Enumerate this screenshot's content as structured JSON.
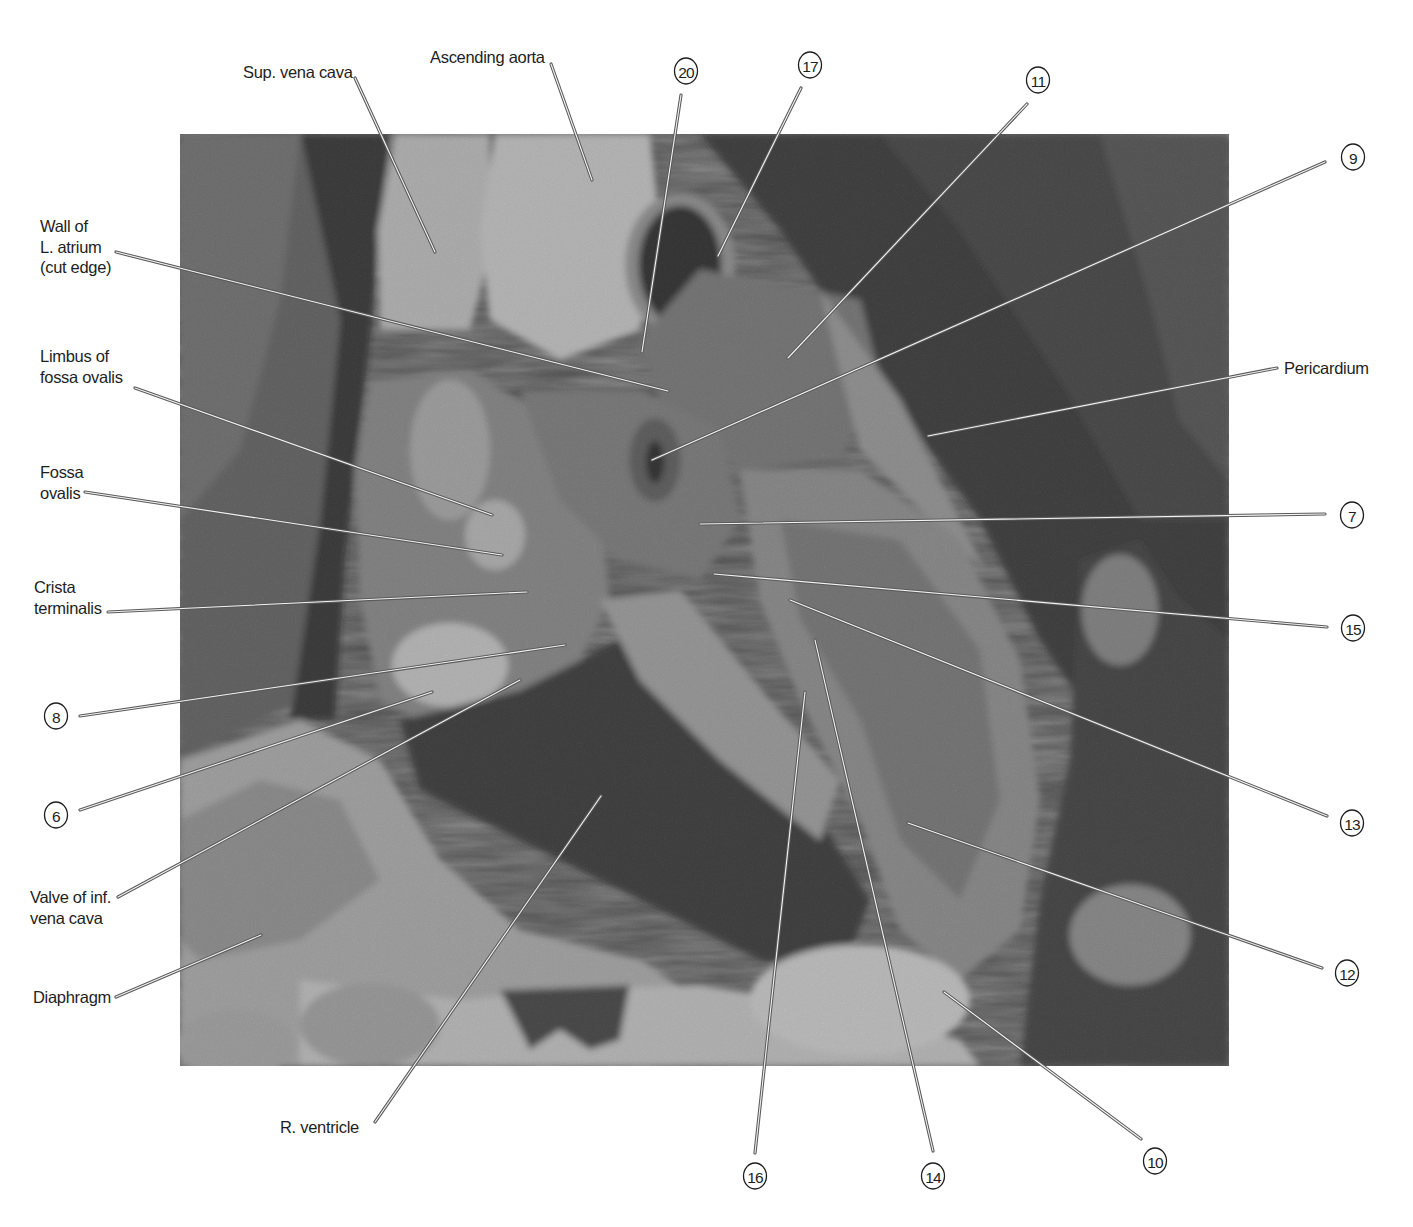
{
  "figure": {
    "photo_frame": {
      "x": 180,
      "y": 134,
      "width": 1049,
      "height": 932
    },
    "colors": {
      "background": "#ffffff",
      "label_text": "#1e1e1e",
      "leader_dark": "#5a5a5a",
      "leader_light": "#f4f4f4",
      "photo_dark": "#0e0e0e",
      "photo_mid": "#6a6a6a",
      "photo_light": "#d2d2d2"
    }
  },
  "labels": [
    {
      "id": "sup-vena-cava",
      "text": [
        "Sup. vena cava"
      ],
      "x": 243,
      "y": 78,
      "anchor": "start",
      "line": [
        [
          355,
          78
        ],
        [
          435,
          252
        ]
      ]
    },
    {
      "id": "ascending-aorta",
      "text": [
        "Ascending aorta"
      ],
      "x": 430,
      "y": 63,
      "anchor": "start",
      "line": [
        [
          551,
          64
        ],
        [
          592,
          180
        ]
      ]
    },
    {
      "id": "wall-of-l-atrium",
      "text": [
        "Wall of",
        "L. atrium",
        "(cut edge)"
      ],
      "x": 40,
      "y": 232,
      "anchor": "start",
      "line": [
        [
          116,
          252
        ],
        [
          668,
          391
        ]
      ]
    },
    {
      "id": "limbus-of-fossa-ovalis",
      "text": [
        "Limbus of",
        "fossa ovalis"
      ],
      "x": 40,
      "y": 362,
      "anchor": "start",
      "line": [
        [
          135,
          388
        ],
        [
          492,
          515
        ]
      ]
    },
    {
      "id": "fossa-ovalis",
      "text": [
        "Fossa",
        "ovalis"
      ],
      "x": 40,
      "y": 478,
      "anchor": "start",
      "line": [
        [
          85,
          492
        ],
        [
          502,
          555
        ]
      ]
    },
    {
      "id": "crista-terminalis",
      "text": [
        "Crista",
        "terminalis"
      ],
      "x": 34,
      "y": 593,
      "anchor": "start",
      "line": [
        [
          108,
          612
        ],
        [
          527,
          592
        ]
      ]
    },
    {
      "id": "valve-of-inf-vena-cava",
      "text": [
        "Valve of inf.",
        "vena cava"
      ],
      "x": 30,
      "y": 903,
      "anchor": "start",
      "line": [
        [
          118,
          897
        ],
        [
          520,
          680
        ]
      ]
    },
    {
      "id": "diaphragm",
      "text": [
        "Diaphragm"
      ],
      "x": 33,
      "y": 1003,
      "anchor": "start",
      "line": [
        [
          116,
          997
        ],
        [
          261,
          935
        ]
      ]
    },
    {
      "id": "r-ventricle",
      "text": [
        "R. ventricle"
      ],
      "x": 280,
      "y": 1133,
      "anchor": "start",
      "line": [
        [
          375,
          1122
        ],
        [
          601,
          796
        ]
      ]
    },
    {
      "id": "pericardium",
      "text": [
        "Pericardium"
      ],
      "x": 1284,
      "y": 374,
      "anchor": "start",
      "line": [
        [
          1277,
          368
        ],
        [
          928,
          436
        ]
      ]
    }
  ],
  "callouts": [
    {
      "number": "20",
      "cx": 686,
      "cy": 71,
      "line": [
        [
          681,
          95
        ],
        [
          642,
          352
        ]
      ]
    },
    {
      "number": "17",
      "cx": 810,
      "cy": 65,
      "line": [
        [
          801,
          88
        ],
        [
          718,
          256
        ]
      ]
    },
    {
      "number": "11",
      "cx": 1038,
      "cy": 80,
      "line": [
        [
          1027,
          104
        ],
        [
          788,
          358
        ]
      ]
    },
    {
      "number": "9",
      "cx": 1353,
      "cy": 157,
      "line": [
        [
          1325,
          162
        ],
        [
          652,
          460
        ]
      ]
    },
    {
      "number": "7",
      "cx": 1352,
      "cy": 515,
      "line": [
        [
          1325,
          514
        ],
        [
          700,
          524
        ]
      ]
    },
    {
      "number": "15",
      "cx": 1353,
      "cy": 628,
      "line": [
        [
          1327,
          627
        ],
        [
          714,
          574
        ]
      ]
    },
    {
      "number": "8",
      "cx": 56,
      "cy": 716,
      "line": [
        [
          80,
          716
        ],
        [
          565,
          645
        ]
      ]
    },
    {
      "number": "6",
      "cx": 56,
      "cy": 815,
      "line": [
        [
          80,
          810
        ],
        [
          432,
          692
        ]
      ]
    },
    {
      "number": "13",
      "cx": 1352,
      "cy": 823,
      "line": [
        [
          1327,
          816
        ],
        [
          790,
          600
        ]
      ]
    },
    {
      "number": "12",
      "cx": 1347,
      "cy": 973,
      "line": [
        [
          1322,
          968
        ],
        [
          908,
          823
        ]
      ]
    },
    {
      "number": "16",
      "cx": 755,
      "cy": 1176,
      "line": [
        [
          755,
          1153
        ],
        [
          805,
          692
        ]
      ]
    },
    {
      "number": "14",
      "cx": 933,
      "cy": 1176,
      "line": [
        [
          933,
          1151
        ],
        [
          815,
          640
        ]
      ]
    },
    {
      "number": "10",
      "cx": 1155,
      "cy": 1161,
      "line": [
        [
          1141,
          1139
        ],
        [
          944,
          992
        ]
      ]
    }
  ]
}
